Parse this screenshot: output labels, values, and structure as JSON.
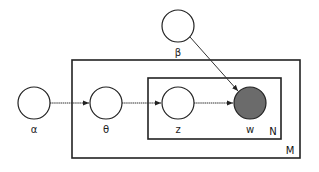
{
  "diagram": {
    "type": "plate-notation",
    "nodes": [
      {
        "id": "alpha",
        "label": "α",
        "cx": 34,
        "cy": 103,
        "r": 16,
        "observed": false
      },
      {
        "id": "theta",
        "label": "θ",
        "cx": 106,
        "cy": 103,
        "r": 16,
        "observed": false
      },
      {
        "id": "z",
        "label": "z",
        "cx": 178,
        "cy": 103,
        "r": 16,
        "observed": false
      },
      {
        "id": "w",
        "label": "w",
        "cx": 250,
        "cy": 103,
        "r": 16,
        "observed": true
      },
      {
        "id": "beta",
        "label": "β",
        "cx": 178,
        "cy": 26,
        "r": 16,
        "observed": false
      }
    ],
    "edges": [
      {
        "from": "alpha",
        "to": "theta"
      },
      {
        "from": "theta",
        "to": "z"
      },
      {
        "from": "z",
        "to": "w"
      },
      {
        "from": "beta",
        "to": "w"
      }
    ],
    "plates": [
      {
        "id": "M",
        "label": "M",
        "x": 72,
        "y": 60,
        "w": 228,
        "h": 98
      },
      {
        "id": "N",
        "label": "N",
        "x": 148,
        "y": 78,
        "w": 133,
        "h": 61
      }
    ],
    "colors": {
      "observed_fill": "#6b6b6b",
      "stroke": "#222222",
      "background": "#ffffff"
    }
  }
}
